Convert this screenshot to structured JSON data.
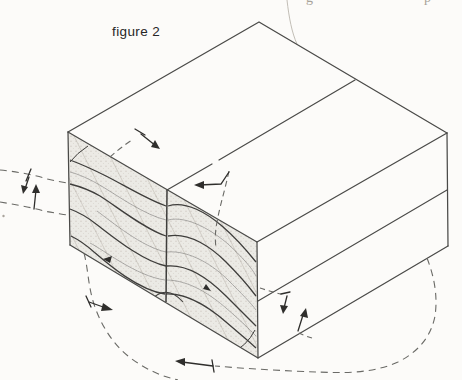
{
  "figure": {
    "label": "figure 2"
  },
  "page_fragments": {
    "top_left_descender": "g",
    "top_right_descender": "p"
  },
  "colors": {
    "background": "#fcfbf9",
    "line": "#4a4a48",
    "shade_fill": "#eceae5",
    "stipple": "#b5afa6",
    "hatch": "#8e887e",
    "dashed": "#6a6a66",
    "arrow": "#2f2e2c",
    "faint": "#c2beb6"
  },
  "icons": [
    "top-face-motion-arrow-downright",
    "top-face-motion-arrow-left",
    "left-shear-arrow-down",
    "left-shear-arrow-up",
    "bottom-left-flow-arrow",
    "bottom-center-flow-arrow",
    "lower-band-shear-arrow-down",
    "lower-band-shear-arrow-up",
    "flowline-arrowhead-left",
    "flowline-arrowhead-right"
  ]
}
